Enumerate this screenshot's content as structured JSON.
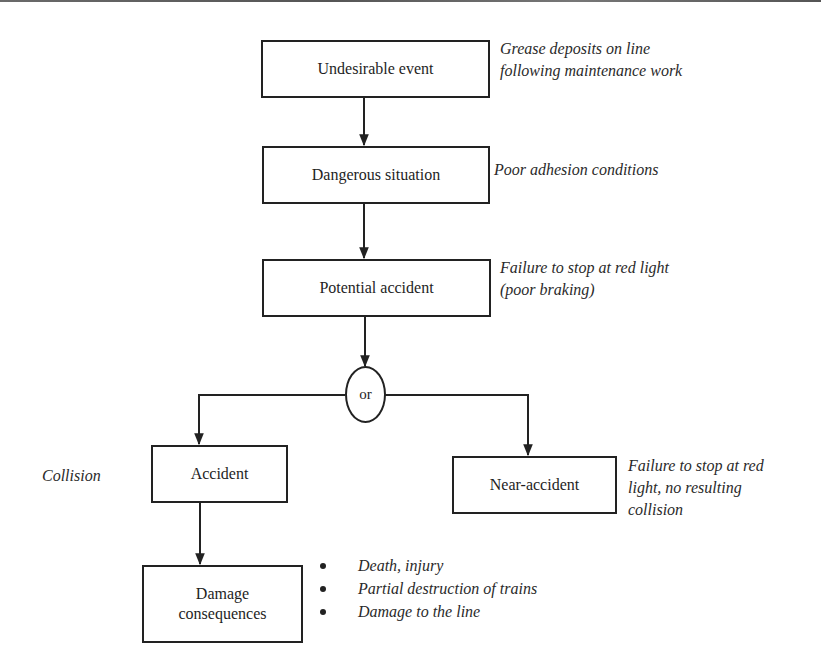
{
  "diagram": {
    "type": "flowchart",
    "nodes": {
      "undesirable_event": {
        "label": "Undesirable event",
        "annotation": [
          "Grease deposits on line",
          "following maintenance work"
        ]
      },
      "dangerous_situation": {
        "label": "Dangerous situation",
        "annotation": [
          "Poor adhesion conditions"
        ]
      },
      "potential_accident": {
        "label": "Potential accident",
        "annotation": [
          "Failure to stop at red light",
          "(poor braking)"
        ]
      },
      "or_gate": {
        "label": "or"
      },
      "accident": {
        "label": "Accident",
        "annotation": [
          "Collision"
        ]
      },
      "near_accident": {
        "label": "Near-accident",
        "annotation": [
          "Failure to stop at red",
          "light, no resulting",
          "collision"
        ]
      },
      "damage_consequences": {
        "label_lines": [
          "Damage",
          "consequences"
        ],
        "annotation_bullets": [
          "Death, injury",
          "Partial destruction of trains",
          "Damage to the line"
        ]
      }
    },
    "edges": [
      {
        "from": "Undesirable event",
        "to": "Dangerous situation"
      },
      {
        "from": "Dangerous situation",
        "to": "Potential accident"
      },
      {
        "from": "Potential accident",
        "to": "or"
      },
      {
        "from": "or",
        "to": "Accident"
      },
      {
        "from": "or",
        "to": "Near-accident"
      },
      {
        "from": "Accident",
        "to": "Damage consequences"
      }
    ]
  }
}
